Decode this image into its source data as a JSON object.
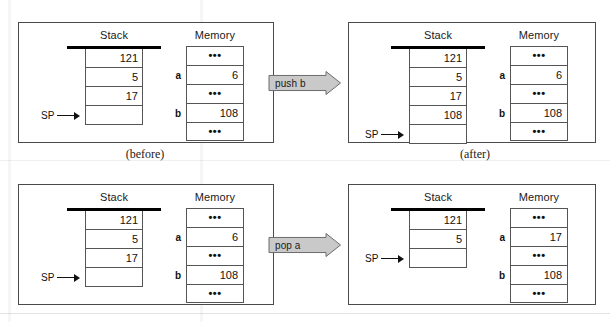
{
  "figure": {
    "background": "#ffffff",
    "arrow_fill": "#c9c9c9",
    "arrow_stroke": "#6b6b6b",
    "stack_bar_color": "#000000",
    "border_color": "#4a4a4a"
  },
  "captions": {
    "before": "(before)",
    "after": "(after)"
  },
  "headings": {
    "stack": "Stack",
    "memory": "Memory"
  },
  "pointer": {
    "sp_label": "SP"
  },
  "glyphs": {
    "ellipsis": "•••"
  },
  "operations": [
    {
      "name": "push",
      "arrow_label": "push b",
      "before": {
        "stack": {
          "cells": [
            "121",
            "5",
            "17",
            ""
          ],
          "sp_index": 3
        },
        "memory": {
          "rows": [
            {
              "label": "",
              "value": "•••",
              "is_dots": true
            },
            {
              "label": "a",
              "value": "6",
              "is_dots": false
            },
            {
              "label": "",
              "value": "•••",
              "is_dots": true
            },
            {
              "label": "b",
              "value": "108",
              "is_dots": false
            },
            {
              "label": "",
              "value": "•••",
              "is_dots": true
            }
          ]
        }
      },
      "after": {
        "stack": {
          "cells": [
            "121",
            "5",
            "17",
            "108",
            ""
          ],
          "sp_index": 4
        },
        "memory": {
          "rows": [
            {
              "label": "",
              "value": "•••",
              "is_dots": true
            },
            {
              "label": "a",
              "value": "6",
              "is_dots": false
            },
            {
              "label": "",
              "value": "•••",
              "is_dots": true
            },
            {
              "label": "b",
              "value": "108",
              "is_dots": false
            },
            {
              "label": "",
              "value": "•••",
              "is_dots": true
            }
          ]
        }
      }
    },
    {
      "name": "pop",
      "arrow_label": "pop a",
      "before": {
        "stack": {
          "cells": [
            "121",
            "5",
            "17",
            ""
          ],
          "sp_index": 3
        },
        "memory": {
          "rows": [
            {
              "label": "",
              "value": "•••",
              "is_dots": true
            },
            {
              "label": "a",
              "value": "6",
              "is_dots": false
            },
            {
              "label": "",
              "value": "•••",
              "is_dots": true
            },
            {
              "label": "b",
              "value": "108",
              "is_dots": false
            },
            {
              "label": "",
              "value": "•••",
              "is_dots": true
            }
          ]
        }
      },
      "after": {
        "stack": {
          "cells": [
            "121",
            "5",
            ""
          ],
          "sp_index": 2
        },
        "memory": {
          "rows": [
            {
              "label": "",
              "value": "•••",
              "is_dots": true
            },
            {
              "label": "a",
              "value": "17",
              "is_dots": false
            },
            {
              "label": "",
              "value": "•••",
              "is_dots": true
            },
            {
              "label": "b",
              "value": "108",
              "is_dots": false
            },
            {
              "label": "",
              "value": "•••",
              "is_dots": true
            }
          ]
        }
      }
    }
  ]
}
